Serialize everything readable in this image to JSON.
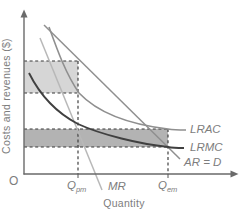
{
  "figure": {
    "y_axis_label": "Costs and revenues ($)",
    "x_axis_label": "Quantity",
    "origin_label": "O"
  },
  "colors": {
    "axis": "#6a6a6a",
    "dashed_guide": "#383838",
    "profit_box_fill": "#d6d6d6",
    "loss_box_fill": "#b3b3b3",
    "mr_stroke": "#b8b8b8",
    "ar_stroke": "#8f8f8f",
    "lrac_stroke": "#8f8f8f",
    "lrmc_stroke": "#404040",
    "text": "#7d7d7d"
  },
  "chart_data": {
    "type": "line",
    "title": "",
    "xlabel": "Quantity",
    "ylabel": "Costs and revenues ($)",
    "grid": "off",
    "axis_numeric_scale": "none (schematic economics diagram)",
    "x_ticks": [
      {
        "base": "Q",
        "sub": "pm"
      },
      {
        "base": "Q",
        "sub": "em"
      }
    ],
    "curves": [
      {
        "name": "marginal-revenue",
        "label": "MR",
        "shape": "straight declining line, steepest slope",
        "color": "#b8b8b8",
        "path": "M40,38 L102,190"
      },
      {
        "name": "average-revenue-demand",
        "label": "AR = D",
        "shape": "straight declining line through top corner of profit box and bottom corner of loss box",
        "color": "#8f8f8f",
        "path": "M44,25 L180,159"
      },
      {
        "name": "long-run-average-cost",
        "label": "LRAC",
        "shape": "convex declining curve through (Qpm, profit-box bottom) and (Qem, loss-box top)",
        "color": "#8f8f8f",
        "path": "M49,27 C58,52 66,74 79,93 C97,112 126,124 168,129 C174,130 180,130 186,130"
      },
      {
        "name": "long-run-marginal-cost",
        "label": "LRMC",
        "shape": "dark convex declining curve below LRAC, meets AR = D at Qem",
        "color": "#404040",
        "path": "M29,73 C40,95 55,112 78,124 C102,135 140,144 168,147 C173,148 179,148 184,148"
      }
    ],
    "shaded_regions": [
      {
        "name": "profit-rectangle",
        "fill": "#d6d6d6",
        "bounds": "y-axis to Qpm guide, between upper two horizontal dashed lines",
        "path": "M24,61 H78 V93 H24 Z"
      },
      {
        "name": "loss-rectangle",
        "fill": "#b3b3b3",
        "bounds": "y-axis to Qem guide, between lower two horizontal dashed lines",
        "path": "M24,129 H168 V147 H24 Z"
      }
    ],
    "guides": [
      {
        "name": "profit-top-dashed",
        "path": "M24,61 H78"
      },
      {
        "name": "profit-bottom-dashed",
        "path": "M24,93 H78"
      },
      {
        "name": "loss-top-dashed",
        "path": "M24,129 H168"
      },
      {
        "name": "loss-bottom-dashed",
        "path": "M24,147 H168"
      },
      {
        "name": "qpm-vertical-dashed",
        "path": "M78,61 V174"
      },
      {
        "name": "qem-vertical-dashed",
        "path": "M168,129 V174"
      }
    ],
    "axes_geometry": {
      "y_axis": "M24,174 L24,16",
      "y_arrow": "M24,9.5 L20.5,17.5 L27.5,17.5 Z",
      "x_axis": "M24,174 L232,174",
      "x_arrow": "M238.5,174 L230.5,170.5 L230.5,177.5 Z",
      "qpm_tick": "M78,174 L78,178",
      "qem_tick": "M168,174 L168,178"
    }
  }
}
